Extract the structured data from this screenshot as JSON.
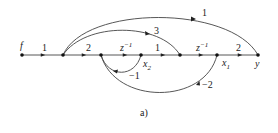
{
  "diagram": {
    "type": "signal-flow-graph",
    "caption": "a)",
    "nodes": {
      "f": "f",
      "x2": "x",
      "x2_sub": "2",
      "x1": "x",
      "x1_sub": "1",
      "y": "y"
    },
    "edges": {
      "f_n1": "1",
      "n1_n2": "2",
      "n2_x2_base": "z",
      "n2_x2_exp": "−1",
      "x2_n4": "1",
      "n4_x1_base": "z",
      "n4_x1_exp": "−1",
      "x1_y": "2",
      "n1_y": "1",
      "n1_n4": "3",
      "x2_n2_feedback": "−1",
      "x1_n2_feedback": "−2"
    },
    "colors": {
      "line": "#333333",
      "node": "#111111"
    }
  }
}
